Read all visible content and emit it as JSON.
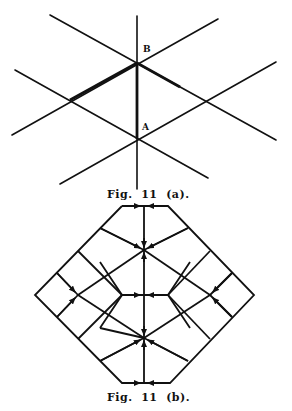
{
  "figure_a": {
    "caption": "Fig.  11  (a).",
    "point_labels": {
      "B": "B",
      "A": "A"
    },
    "points": {
      "B": [
        137,
        63
      ],
      "A": [
        137,
        139
      ]
    }
  },
  "figure_b": {
    "caption": "Fig.  11  (b)."
  },
  "colors": {
    "line": "#111111",
    "background": "#ffffff"
  }
}
